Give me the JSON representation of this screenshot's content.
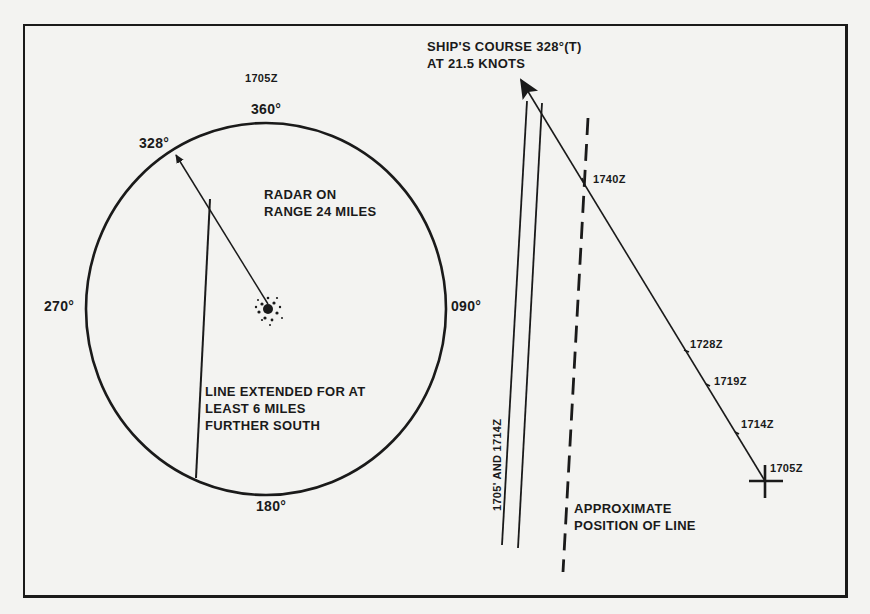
{
  "figure": {
    "type": "radar plot and navigation track diagram"
  },
  "radar_scope": {
    "time_label": "1705Z",
    "bearings": {
      "north": "360°",
      "east": "090°",
      "south": "180°",
      "west": "270°",
      "heading": "328°"
    },
    "range_note": "RADAR ON\nRANGE 24 MILES",
    "line_note": "LINE EXTENDED FOR AT\nLEAST 6 MILES\nFURTHER SOUTH"
  },
  "track_plot": {
    "course_label": "SHIP'S COURSE 328°(T)\nAT 21.5 KNOTS",
    "positions": [
      {
        "time": "1705Z"
      },
      {
        "time": "1714Z"
      },
      {
        "time": "1719Z"
      },
      {
        "time": "1728Z"
      },
      {
        "time": "1740Z"
      }
    ],
    "observed_lines_label": "1705' AND 1714Z",
    "approx_line_label": "APPROXIMATE\nPOSITION OF LINE"
  },
  "colors": {
    "ink": "#1a1a1a",
    "paper": "#f3f3f1"
  }
}
